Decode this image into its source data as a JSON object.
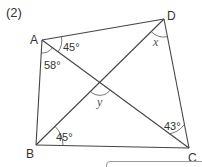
{
  "problem": {
    "number_label": "(2)"
  },
  "diagram": {
    "type": "quadrilateral-with-diagonals",
    "line_color": "#444444",
    "text_color": "#333333",
    "vertices": {
      "A": {
        "label": "A",
        "x": 42,
        "y": 40
      },
      "B": {
        "label": "B",
        "x": 36,
        "y": 145
      },
      "C": {
        "label": "C",
        "x": 189,
        "y": 148
      },
      "D": {
        "label": "D",
        "x": 164,
        "y": 19
      }
    },
    "intersection": {
      "x": 100,
      "y": 82
    },
    "angles": {
      "A_DAC": "45°",
      "A_CAB": "58°",
      "B_DBC": "45°",
      "C_ACB": "43°",
      "D_x": "x",
      "center_y": "y"
    }
  },
  "answer_box": {
    "value": ""
  }
}
